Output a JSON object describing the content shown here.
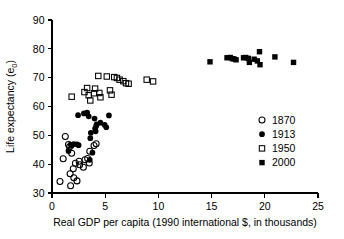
{
  "chart_data": {
    "type": "scatter",
    "title": "",
    "xlabel": "Real GDP per capita (1990 international $, in thousands)",
    "ylabel": "Life expectancy (e",
    "ylabel_sub": "0",
    "ylabel_suffix": ")",
    "xlim": [
      0,
      25
    ],
    "ylim": [
      30,
      90
    ],
    "xticks": [
      0,
      5,
      10,
      15,
      20,
      25
    ],
    "yticks": [
      30,
      40,
      50,
      60,
      70,
      80,
      90
    ],
    "xtick_labels": [
      "0",
      "5",
      "10",
      "15",
      "20",
      "25"
    ],
    "ytick_labels": [
      "30",
      "40",
      "50",
      "60",
      "70",
      "80",
      "90"
    ],
    "grid": false,
    "legend_position": "right-middle",
    "marker_colors": {
      "outline": "#000000",
      "fill": "#000000",
      "background": "#ffffff"
    },
    "series": [
      {
        "name": "1870",
        "marker": "open-circle",
        "points": [
          [
            0.75,
            34.0
          ],
          [
            1.05,
            41.9
          ],
          [
            1.25,
            49.6
          ],
          [
            1.55,
            46.8
          ],
          [
            1.65,
            46.0
          ],
          [
            1.7,
            36.7
          ],
          [
            1.75,
            32.5
          ],
          [
            1.85,
            43.8
          ],
          [
            2.0,
            38.4
          ],
          [
            2.05,
            35.3
          ],
          [
            2.2,
            40.3
          ],
          [
            2.35,
            34.2
          ],
          [
            2.55,
            41.0
          ],
          [
            2.6,
            39.8
          ],
          [
            2.95,
            38.9
          ],
          [
            3.1,
            41.5
          ],
          [
            3.35,
            42.0
          ],
          [
            3.5,
            40.4
          ],
          [
            3.55,
            44.5
          ],
          [
            3.95,
            46.5
          ],
          [
            4.15,
            47.1
          ]
        ]
      },
      {
        "name": "1913",
        "marker": "filled-circle",
        "points": [
          [
            1.55,
            44.6
          ],
          [
            1.75,
            46.8
          ],
          [
            1.85,
            46.4
          ],
          [
            2.05,
            47.0
          ],
          [
            2.35,
            46.9
          ],
          [
            2.45,
            57.0
          ],
          [
            2.5,
            46.6
          ],
          [
            3.0,
            57.6
          ],
          [
            3.3,
            57.9
          ],
          [
            3.45,
            56.6
          ],
          [
            3.55,
            41.5
          ],
          [
            3.6,
            49.0
          ],
          [
            3.65,
            50.9
          ],
          [
            3.8,
            44.0
          ],
          [
            4.0,
            55.8
          ],
          [
            4.05,
            52.3
          ],
          [
            4.1,
            51.4
          ],
          [
            4.15,
            53.2
          ],
          [
            4.2,
            53.8
          ],
          [
            4.55,
            54.4
          ],
          [
            4.95,
            53.6
          ],
          [
            5.1,
            52.8
          ],
          [
            5.35,
            56.9
          ]
        ]
      },
      {
        "name": "1950",
        "marker": "open-square",
        "points": [
          [
            1.85,
            63.4
          ],
          [
            3.05,
            65.0
          ],
          [
            3.3,
            66.4
          ],
          [
            3.45,
            63.9
          ],
          [
            3.6,
            62.1
          ],
          [
            3.95,
            64.6
          ],
          [
            4.05,
            66.2
          ],
          [
            4.35,
            70.6
          ],
          [
            4.45,
            64.7
          ],
          [
            4.55,
            63.2
          ],
          [
            5.15,
            70.4
          ],
          [
            5.45,
            65.6
          ],
          [
            5.6,
            64.1
          ],
          [
            5.85,
            70.2
          ],
          [
            6.1,
            69.9
          ],
          [
            6.35,
            69.3
          ],
          [
            6.7,
            68.8
          ],
          [
            6.95,
            68.1
          ],
          [
            7.2,
            67.9
          ],
          [
            8.9,
            69.3
          ],
          [
            9.5,
            68.7
          ]
        ]
      },
      {
        "name": "2000",
        "marker": "filled-square",
        "points": [
          [
            14.85,
            75.5
          ],
          [
            16.45,
            76.9
          ],
          [
            16.75,
            77.0
          ],
          [
            16.95,
            76.6
          ],
          [
            17.1,
            76.5
          ],
          [
            17.3,
            76.2
          ],
          [
            18.0,
            76.9
          ],
          [
            18.2,
            77.0
          ],
          [
            18.45,
            76.7
          ],
          [
            18.55,
            75.3
          ],
          [
            19.0,
            76.4
          ],
          [
            19.3,
            75.8
          ],
          [
            19.5,
            79.0
          ],
          [
            19.55,
            74.5
          ],
          [
            20.95,
            77.2
          ],
          [
            22.7,
            75.3
          ]
        ]
      }
    ],
    "legend_entries": [
      {
        "label": "1870",
        "marker": "open-circle"
      },
      {
        "label": "1913",
        "marker": "filled-circle"
      },
      {
        "label": "1950",
        "marker": "open-square"
      },
      {
        "label": "2000",
        "marker": "filled-square"
      }
    ]
  }
}
